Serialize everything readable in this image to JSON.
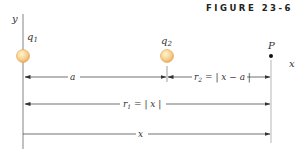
{
  "figure": {
    "title": "FIGURE 23-6",
    "axes": {
      "y_label": "y",
      "x_label": "x"
    },
    "points": {
      "q1": {
        "label": "q",
        "sub": "1"
      },
      "q2": {
        "label": "q",
        "sub": "2"
      },
      "p": {
        "label": "P"
      }
    },
    "dimensions": {
      "a": {
        "label": "a"
      },
      "r2": {
        "label_prefix": "r",
        "sub": "2",
        "expr": " = | x − a |"
      },
      "r1": {
        "label_prefix": "r",
        "sub": "1",
        "expr": " = | x |"
      },
      "x": {
        "label": "x"
      }
    },
    "colors": {
      "charge_fill": "#f6d08a",
      "charge_stroke": "#e8a85a",
      "axis": "#555555",
      "axis_highlight": "#d9909a",
      "axis_cyan": "#7fb8c8",
      "r2_equals": "#4caf50",
      "text": "#333333"
    }
  }
}
